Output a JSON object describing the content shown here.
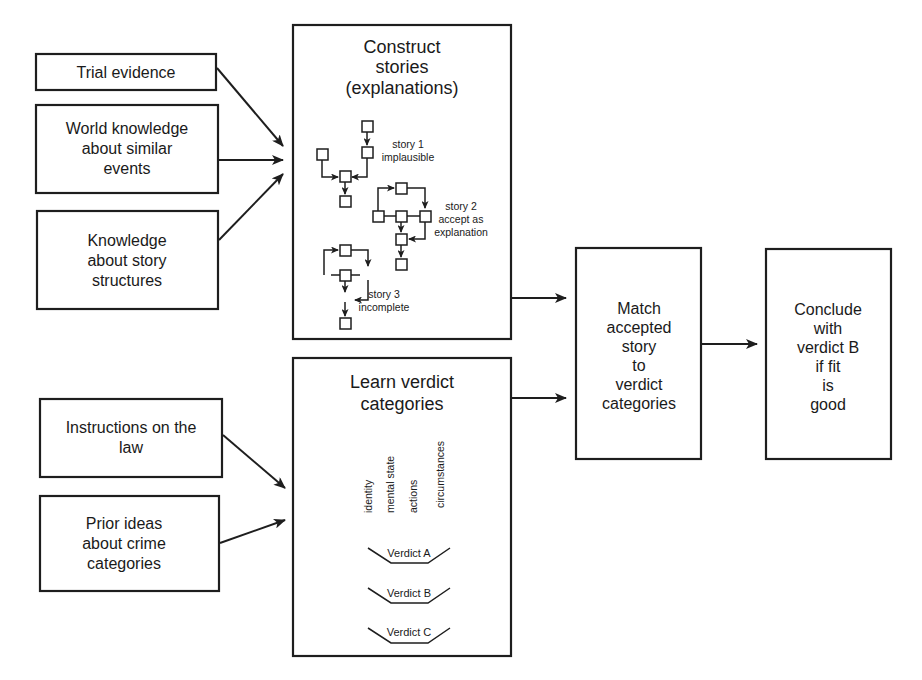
{
  "diagram": {
    "inputs_story": [
      {
        "id": "trial-evidence",
        "lines": [
          "Trial evidence"
        ]
      },
      {
        "id": "world-knowledge",
        "lines": [
          "World knowledge",
          "about similar",
          "events"
        ]
      },
      {
        "id": "story-structures",
        "lines": [
          "Knowledge",
          "about story",
          "structures"
        ]
      }
    ],
    "inputs_verdict": [
      {
        "id": "instructions-law",
        "lines": [
          "Instructions on the",
          "law"
        ]
      },
      {
        "id": "prior-ideas",
        "lines": [
          "Prior  ideas",
          "about crime",
          "categories"
        ]
      }
    ],
    "construct": {
      "title": [
        "Construct",
        "stories",
        "(explanations)"
      ],
      "stories": [
        {
          "name": "story 1",
          "status": "implausible"
        },
        {
          "name": "story 2",
          "status_lines": [
            "accept as",
            "explanation"
          ]
        },
        {
          "name": "story 3",
          "status": "incomplete"
        }
      ]
    },
    "learn": {
      "title": [
        "Learn verdict",
        "categories"
      ],
      "attributes": [
        "identity",
        "mental state",
        "actions",
        "circumstances"
      ],
      "verdicts": [
        "Verdict A",
        "Verdict B",
        "Verdict C"
      ]
    },
    "match": {
      "lines": [
        "Match",
        "accepted",
        "story",
        "to",
        "verdict",
        "categories"
      ]
    },
    "conclude": {
      "lines": [
        "Conclude",
        "with",
        "verdict B",
        "if fit",
        "is",
        "good"
      ]
    }
  }
}
